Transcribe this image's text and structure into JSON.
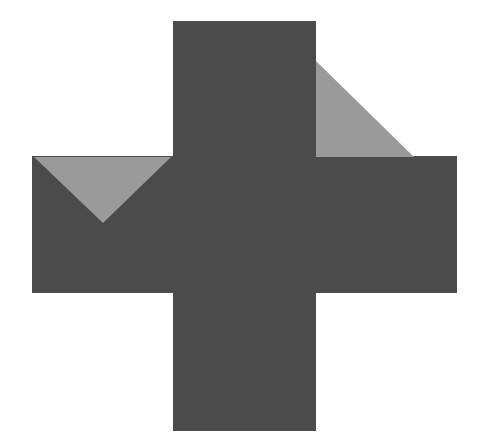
{
  "diagram": {
    "colors": {
      "background": "#ffffff",
      "cross": "#4b4b4b",
      "wedge": "#9a9a9a"
    },
    "shapes": [
      {
        "id": "vertical-bar",
        "kind": "rectangle",
        "fill": "cross"
      },
      {
        "id": "horizontal-bar",
        "kind": "rectangle",
        "fill": "cross"
      },
      {
        "id": "left-wedge",
        "kind": "triangle",
        "fill": "wedge"
      },
      {
        "id": "right-wedge",
        "kind": "triangle",
        "fill": "wedge"
      }
    ]
  }
}
